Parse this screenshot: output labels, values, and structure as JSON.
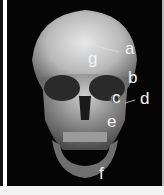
{
  "figure": {
    "labels": [
      "a",
      "b",
      "c",
      "d",
      "e",
      "f",
      "g"
    ]
  },
  "colors": {
    "background": "#050505",
    "label": "#f2f2f2"
  }
}
